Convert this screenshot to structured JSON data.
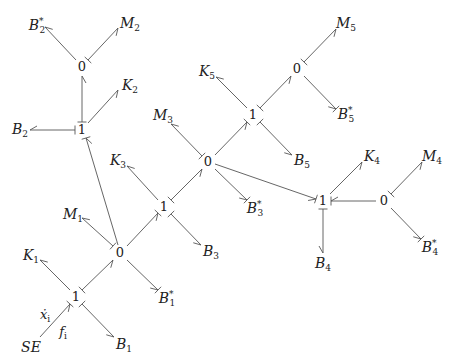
{
  "diagram": {
    "type": "bond-graph",
    "nodes": [
      {
        "id": "j0_top",
        "label": "0",
        "x": 82,
        "y": 67
      },
      {
        "id": "j1_b2",
        "label": "1",
        "x": 82,
        "y": 130
      },
      {
        "id": "j1_se",
        "label": "1",
        "x": 76,
        "y": 297
      },
      {
        "id": "j0_m1",
        "label": "0",
        "x": 120,
        "y": 253
      },
      {
        "id": "j1_k3",
        "label": "1",
        "x": 164,
        "y": 207
      },
      {
        "id": "j0_m3",
        "label": "0",
        "x": 208,
        "y": 162
      },
      {
        "id": "j1_k5",
        "label": "1",
        "x": 253,
        "y": 115
      },
      {
        "id": "j0_m5",
        "label": "0",
        "x": 297,
        "y": 69
      },
      {
        "id": "j1_k4",
        "label": "1",
        "x": 323,
        "y": 201
      },
      {
        "id": "j0_m4",
        "label": "0",
        "x": 384,
        "y": 201
      }
    ],
    "elements": [
      {
        "id": "B2s",
        "base": "B",
        "sub": "2",
        "star": true,
        "x": 37,
        "y": 24
      },
      {
        "id": "M2",
        "base": "M",
        "sub": "2",
        "star": false,
        "x": 130,
        "y": 24
      },
      {
        "id": "K2",
        "base": "K",
        "sub": "2",
        "star": false,
        "x": 130,
        "y": 86
      },
      {
        "id": "B2",
        "base": "B",
        "sub": "2",
        "star": false,
        "x": 20,
        "y": 130
      },
      {
        "id": "M3",
        "base": "M",
        "sub": "3",
        "star": false,
        "x": 163,
        "y": 116
      },
      {
        "id": "K5",
        "base": "K",
        "sub": "5",
        "star": false,
        "x": 207,
        "y": 72
      },
      {
        "id": "M5",
        "base": "M",
        "sub": "5",
        "star": false,
        "x": 346,
        "y": 24
      },
      {
        "id": "B5s",
        "base": "B",
        "sub": "5",
        "star": true,
        "x": 346,
        "y": 113
      },
      {
        "id": "B5",
        "base": "B",
        "sub": "5",
        "star": false,
        "x": 302,
        "y": 161
      },
      {
        "id": "K3",
        "base": "K",
        "sub": "3",
        "star": false,
        "x": 118,
        "y": 161
      },
      {
        "id": "B3s",
        "base": "B",
        "sub": "3",
        "star": true,
        "x": 255,
        "y": 207
      },
      {
        "id": "K4",
        "base": "K",
        "sub": "4",
        "star": false,
        "x": 372,
        "y": 157
      },
      {
        "id": "M4",
        "base": "M",
        "sub": "4",
        "star": false,
        "x": 432,
        "y": 157
      },
      {
        "id": "B4s",
        "base": "B",
        "sub": "4",
        "star": true,
        "x": 430,
        "y": 246
      },
      {
        "id": "B4",
        "base": "B",
        "sub": "4",
        "star": false,
        "x": 323,
        "y": 264
      },
      {
        "id": "M1",
        "base": "M",
        "sub": "1",
        "star": false,
        "x": 73,
        "y": 215
      },
      {
        "id": "B3",
        "base": "B",
        "sub": "3",
        "star": false,
        "x": 211,
        "y": 252
      },
      {
        "id": "K1",
        "base": "K",
        "sub": "1",
        "star": false,
        "x": 31,
        "y": 256
      },
      {
        "id": "B1s",
        "base": "B",
        "sub": "1",
        "star": true,
        "x": 167,
        "y": 297
      },
      {
        "id": "B1",
        "base": "B",
        "sub": "1",
        "star": false,
        "x": 124,
        "y": 345
      },
      {
        "id": "SE",
        "base": "SE",
        "sub": "",
        "star": false,
        "x": 31,
        "y": 347
      }
    ],
    "annotations": [
      {
        "id": "xdot",
        "text": "ẋ",
        "sub": "i",
        "x": 45,
        "y": 315
      },
      {
        "id": "f",
        "text": "f",
        "sub": "i",
        "x": 63,
        "y": 332
      }
    ],
    "bonds": [
      {
        "from": [
          76,
          60
        ],
        "to": [
          45,
          27
        ],
        "arrow": "end",
        "stroke": "start-none"
      },
      {
        "from": [
          88,
          60
        ],
        "to": [
          118,
          28
        ],
        "stroke": "from",
        "arrow": "end"
      },
      {
        "from": [
          82,
          122
        ],
        "to": [
          82,
          76
        ],
        "stroke": "from",
        "arrow": "end"
      },
      {
        "from": [
          88,
          123
        ],
        "to": [
          118,
          90
        ],
        "arrow": "end"
      },
      {
        "from": [
          75,
          130
        ],
        "to": [
          30,
          130
        ],
        "stroke": "from",
        "arrow": "end"
      },
      {
        "from": [
          118,
          245
        ],
        "to": [
          86,
          138
        ],
        "arrow": "end",
        "stroke": "to"
      },
      {
        "from": [
          113,
          246
        ],
        "to": [
          82,
          218
        ],
        "stroke": "from",
        "arrow": "end"
      },
      {
        "from": [
          127,
          246
        ],
        "to": [
          158,
          213
        ],
        "arrow": "end",
        "stroke": "to"
      },
      {
        "from": [
          127,
          260
        ],
        "to": [
          158,
          290
        ],
        "arrow": "end",
        "stroke": "to"
      },
      {
        "from": [
          70,
          290
        ],
        "to": [
          40,
          260
        ],
        "arrow": "end"
      },
      {
        "from": [
          82,
          290
        ],
        "to": [
          113,
          260
        ],
        "stroke": "from",
        "arrow": "end"
      },
      {
        "from": [
          40,
          337
        ],
        "to": [
          70,
          304
        ],
        "arrow": "end",
        "stroke": "to"
      },
      {
        "from": [
          82,
          304
        ],
        "to": [
          114,
          337
        ],
        "stroke": "from",
        "arrow": "end"
      },
      {
        "from": [
          158,
          200
        ],
        "to": [
          127,
          166
        ],
        "arrow": "end"
      },
      {
        "from": [
          171,
          200
        ],
        "to": [
          202,
          169
        ],
        "stroke": "from",
        "arrow": "end"
      },
      {
        "from": [
          171,
          214
        ],
        "to": [
          201,
          245
        ],
        "stroke": "from",
        "arrow": "end"
      },
      {
        "from": [
          202,
          156
        ],
        "to": [
          171,
          124
        ],
        "stroke": "from",
        "arrow": "end"
      },
      {
        "from": [
          215,
          155
        ],
        "to": [
          247,
          122
        ],
        "arrow": "end",
        "stroke": "to"
      },
      {
        "from": [
          215,
          169
        ],
        "to": [
          247,
          200
        ],
        "arrow": "end",
        "stroke": "to"
      },
      {
        "from": [
          215,
          164
        ],
        "to": [
          316,
          199
        ],
        "arrow": "end",
        "stroke": "to"
      },
      {
        "from": [
          247,
          108
        ],
        "to": [
          216,
          77
        ],
        "arrow": "end"
      },
      {
        "from": [
          260,
          108
        ],
        "to": [
          291,
          76
        ],
        "stroke": "from",
        "arrow": "end"
      },
      {
        "from": [
          260,
          122
        ],
        "to": [
          292,
          155
        ],
        "stroke": "from",
        "arrow": "end"
      },
      {
        "from": [
          304,
          62
        ],
        "to": [
          336,
          29
        ],
        "stroke": "from",
        "arrow": "end"
      },
      {
        "from": [
          304,
          76
        ],
        "to": [
          336,
          109
        ],
        "arrow": "end",
        "stroke": "to"
      },
      {
        "from": [
          330,
          194
        ],
        "to": [
          362,
          162
        ],
        "arrow": "end"
      },
      {
        "from": [
          376,
          201
        ],
        "to": [
          331,
          201
        ],
        "arrow": "end",
        "stroke": "to"
      },
      {
        "from": [
          323,
          209
        ],
        "to": [
          323,
          253
        ],
        "stroke": "from",
        "arrow": "end"
      },
      {
        "from": [
          391,
          194
        ],
        "to": [
          422,
          162
        ],
        "stroke": "from",
        "arrow": "end"
      },
      {
        "from": [
          391,
          208
        ],
        "to": [
          421,
          239
        ],
        "arrow": "end",
        "stroke": "to"
      }
    ]
  }
}
